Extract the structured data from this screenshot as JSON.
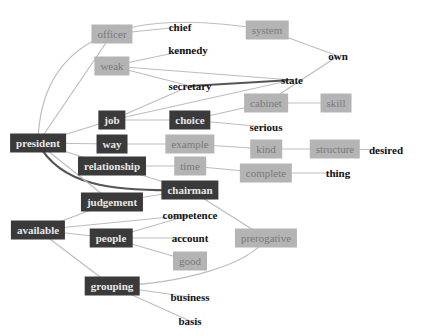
{
  "diagram": {
    "type": "word-association-graph",
    "colors": {
      "dark_node_bg": "#3a3a3a",
      "dark_node_text": "#e8e8e8",
      "light_node_bg": "#b4b4b4",
      "light_node_text": "#7a7a7a",
      "plain_text": "#111111",
      "edge": "#bdbdbd",
      "strong_edge": "#555555"
    },
    "nodes": [
      {
        "id": "president",
        "label": "president",
        "style": "dark"
      },
      {
        "id": "officer",
        "label": "officer",
        "style": "light"
      },
      {
        "id": "chief",
        "label": "chief",
        "style": "text"
      },
      {
        "id": "system",
        "label": "system",
        "style": "light"
      },
      {
        "id": "own",
        "label": "own",
        "style": "text"
      },
      {
        "id": "weak",
        "label": "weak",
        "style": "light"
      },
      {
        "id": "kennedy",
        "label": "kennedy",
        "style": "text"
      },
      {
        "id": "secretary",
        "label": "secretary",
        "style": "text"
      },
      {
        "id": "state",
        "label": "state",
        "style": "text"
      },
      {
        "id": "job",
        "label": "job",
        "style": "dark"
      },
      {
        "id": "choice",
        "label": "choice",
        "style": "dark"
      },
      {
        "id": "cabinet",
        "label": "cabinet",
        "style": "light"
      },
      {
        "id": "skill",
        "label": "skill",
        "style": "light"
      },
      {
        "id": "serious",
        "label": "serious",
        "style": "text"
      },
      {
        "id": "way",
        "label": "way",
        "style": "dark"
      },
      {
        "id": "example",
        "label": "example",
        "style": "light"
      },
      {
        "id": "kind",
        "label": "kind",
        "style": "light"
      },
      {
        "id": "structure",
        "label": "structure",
        "style": "light"
      },
      {
        "id": "desired",
        "label": "desired",
        "style": "text"
      },
      {
        "id": "relationship",
        "label": "relationship",
        "style": "dark"
      },
      {
        "id": "time",
        "label": "time",
        "style": "light"
      },
      {
        "id": "complete",
        "label": "complete",
        "style": "light"
      },
      {
        "id": "thing",
        "label": "thing",
        "style": "text"
      },
      {
        "id": "chairman",
        "label": "chairman",
        "style": "dark"
      },
      {
        "id": "judgement",
        "label": "judgement",
        "style": "dark"
      },
      {
        "id": "available",
        "label": "available",
        "style": "dark"
      },
      {
        "id": "competence",
        "label": "competence",
        "style": "text"
      },
      {
        "id": "people",
        "label": "people",
        "style": "dark"
      },
      {
        "id": "account",
        "label": "account",
        "style": "text"
      },
      {
        "id": "good",
        "label": "good",
        "style": "light"
      },
      {
        "id": "prerogative",
        "label": "prerogative",
        "style": "light"
      },
      {
        "id": "grouping",
        "label": "grouping",
        "style": "dark"
      },
      {
        "id": "business",
        "label": "business",
        "style": "text"
      },
      {
        "id": "basis",
        "label": "basis",
        "style": "text"
      }
    ],
    "edges": [
      {
        "from": "president",
        "to": "system",
        "strength": "weak"
      },
      {
        "from": "president",
        "to": "officer",
        "strength": "weak"
      },
      {
        "from": "president",
        "to": "job",
        "strength": "weak"
      },
      {
        "from": "president",
        "to": "way",
        "strength": "weak"
      },
      {
        "from": "president",
        "to": "relationship",
        "strength": "weak"
      },
      {
        "from": "president",
        "to": "chairman",
        "strength": "strong"
      },
      {
        "from": "president",
        "to": "judgement",
        "strength": "weak"
      },
      {
        "from": "officer",
        "to": "chief",
        "strength": "weak"
      },
      {
        "from": "system",
        "to": "own",
        "strength": "weak"
      },
      {
        "from": "weak",
        "to": "kennedy",
        "strength": "weak"
      },
      {
        "from": "weak",
        "to": "state",
        "strength": "weak"
      },
      {
        "from": "weak",
        "to": "secretary",
        "strength": "weak"
      },
      {
        "from": "secretary",
        "to": "state",
        "strength": "strong"
      },
      {
        "from": "job",
        "to": "secretary",
        "strength": "weak"
      },
      {
        "from": "job",
        "to": "state",
        "strength": "weak"
      },
      {
        "from": "job",
        "to": "choice",
        "strength": "weak"
      },
      {
        "from": "choice",
        "to": "cabinet",
        "strength": "weak"
      },
      {
        "from": "choice",
        "to": "serious",
        "strength": "weak"
      },
      {
        "from": "cabinet",
        "to": "own",
        "strength": "weak"
      },
      {
        "from": "cabinet",
        "to": "skill",
        "strength": "weak"
      },
      {
        "from": "way",
        "to": "example",
        "strength": "weak"
      },
      {
        "from": "example",
        "to": "kind",
        "strength": "weak"
      },
      {
        "from": "kind",
        "to": "structure",
        "strength": "weak"
      },
      {
        "from": "structure",
        "to": "desired",
        "strength": "weak"
      },
      {
        "from": "relationship",
        "to": "time",
        "strength": "weak"
      },
      {
        "from": "relationship",
        "to": "chairman",
        "strength": "weak"
      },
      {
        "from": "time",
        "to": "complete",
        "strength": "weak"
      },
      {
        "from": "complete",
        "to": "thing",
        "strength": "weak"
      },
      {
        "from": "chairman",
        "to": "prerogative",
        "strength": "weak"
      },
      {
        "from": "judgement",
        "to": "chairman",
        "strength": "weak"
      },
      {
        "from": "judgement",
        "to": "available",
        "strength": "weak"
      },
      {
        "from": "available",
        "to": "competence",
        "strength": "weak"
      },
      {
        "from": "available",
        "to": "people",
        "strength": "weak"
      },
      {
        "from": "available",
        "to": "grouping",
        "strength": "weak"
      },
      {
        "from": "people",
        "to": "competence",
        "strength": "weak"
      },
      {
        "from": "people",
        "to": "account",
        "strength": "weak"
      },
      {
        "from": "people",
        "to": "good",
        "strength": "weak"
      },
      {
        "from": "grouping",
        "to": "prerogative",
        "strength": "weak"
      },
      {
        "from": "grouping",
        "to": "business",
        "strength": "weak"
      },
      {
        "from": "grouping",
        "to": "basis",
        "strength": "weak"
      }
    ]
  }
}
